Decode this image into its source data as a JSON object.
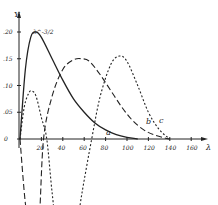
{
  "chart_data": {
    "type": "line",
    "title": "",
    "xlabel": "λ",
    "ylabel": "Y",
    "y_unit_label": "λ^-3/2",
    "xlim": [
      0,
      170
    ],
    "ylim": [
      -0.25,
      0.22
    ],
    "x_ticks": [
      "20",
      "40",
      "60",
      "80",
      "100",
      "120",
      "140",
      "160"
    ],
    "y_ticks": [
      "0",
      ".05",
      ".10",
      ".15",
      ".20"
    ],
    "grid": false,
    "legend": "inline curve labels a, b, c",
    "series": [
      {
        "name": "a",
        "style": "solid",
        "x": [
          0,
          5,
          10,
          15,
          20,
          30,
          40,
          50,
          60,
          70,
          80,
          90,
          100,
          110
        ],
        "y": [
          0,
          0.13,
          0.19,
          0.2,
          0.19,
          0.15,
          0.11,
          0.075,
          0.05,
          0.03,
          0.017,
          0.008,
          0.003,
          0
        ]
      },
      {
        "name": "b",
        "style": "dash",
        "x": [
          0,
          5,
          10,
          14,
          18,
          22,
          30,
          40,
          50,
          58,
          65,
          75,
          85,
          95,
          105,
          115,
          125,
          135,
          140
        ],
        "y": [
          0,
          -0.12,
          -0.18,
          -0.19,
          -0.15,
          0,
          0.08,
          0.13,
          0.148,
          0.15,
          0.145,
          0.12,
          0.09,
          0.06,
          0.035,
          0.018,
          0.008,
          0.002,
          0
        ]
      },
      {
        "name": "c",
        "style": "dotted",
        "x": [
          0,
          4,
          8,
          11,
          15,
          20,
          25,
          30,
          36,
          43,
          50,
          58,
          67,
          75,
          85,
          93,
          100,
          110,
          120,
          130,
          140
        ],
        "y": [
          0,
          0.06,
          0.085,
          0.09,
          0.08,
          0.04,
          0,
          -0.1,
          -0.2,
          -0.23,
          -0.2,
          -0.1,
          0,
          0.08,
          0.14,
          0.155,
          0.145,
          0.1,
          0.05,
          0.018,
          0
        ]
      }
    ],
    "annotations": [
      "a",
      "b",
      "c"
    ]
  }
}
